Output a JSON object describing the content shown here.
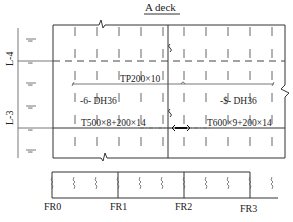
{
  "title": "A deck",
  "levels": [
    {
      "label": "L-4"
    },
    {
      "label": "L-3"
    }
  ],
  "annotations": {
    "top_plate": "TP200×10",
    "left_grade": "-6- DH36",
    "right_grade": "-$- DH36",
    "left_girder": "T500×8+200×14",
    "right_girder": "T600×9+200×14"
  },
  "frames": [
    {
      "label": "FR0"
    },
    {
      "label": "FR1"
    },
    {
      "label": "FR2"
    },
    {
      "label": "FR3"
    }
  ],
  "ruler_tick_label": "zzz"
}
